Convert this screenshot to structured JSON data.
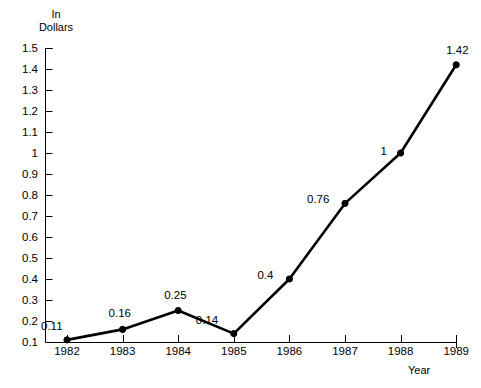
{
  "chart_data": {
    "type": "line",
    "title": "",
    "xlabel": "Year",
    "ylabel": "In\nDollars",
    "categories": [
      "1982",
      "1983",
      "1984",
      "1985",
      "1986",
      "1987",
      "1988",
      "1989"
    ],
    "values": [
      0.11,
      0.16,
      0.25,
      0.14,
      0.4,
      0.76,
      1,
      1.42
    ],
    "point_labels": [
      "0.11",
      "0.16",
      "0.25",
      "0.14",
      "0.4",
      "0.76",
      "1",
      "1.42"
    ],
    "series": [
      {
        "name": "",
        "values": [
          0.11,
          0.16,
          0.25,
          0.14,
          0.4,
          0.76,
          1,
          1.42
        ]
      }
    ],
    "x": [
      "1982",
      "1983",
      "1984",
      "1985",
      "1986",
      "1987",
      "1988",
      "1989"
    ],
    "ylim": [
      0.1,
      1.5
    ],
    "ytick_labels": [
      "1.5",
      "1.4",
      "1.3",
      "1.2",
      "1.1",
      "1",
      "0.9",
      "0.8",
      "0.7",
      "0.6",
      "0.5",
      "0.4",
      "0.3",
      "0.2",
      "0.1"
    ],
    "ytick_values": [
      1.5,
      1.4,
      1.3,
      1.2,
      1.1,
      1,
      0.9,
      0.8,
      0.7,
      0.6,
      0.5,
      0.4,
      0.3,
      0.2,
      0.1
    ],
    "xtick_labels": [
      "1982",
      "1983",
      "1984",
      "1985",
      "1986",
      "1987",
      "1988",
      "1989"
    ],
    "grid": false,
    "legend": false,
    "legend_position": "none",
    "line_color": "#000000",
    "marker": "filled-circle",
    "marker_color": "#000000",
    "axis_color": "#000000",
    "background_color": "#ffffff"
  }
}
